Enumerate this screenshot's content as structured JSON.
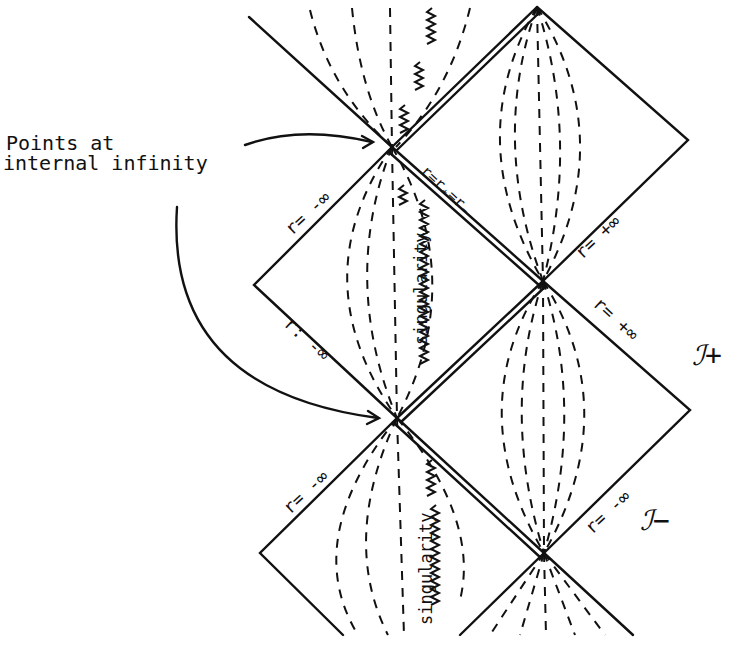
{
  "diagram": {
    "type": "Penrose (conformal) diagram",
    "callout": {
      "line1": "Points   at",
      "line2": "internal infinity"
    },
    "labels": {
      "horizon": "r=r₊=r₋",
      "r_minus_inf_1": "r= -∞",
      "r_minus_inf_2": "r: -∞",
      "r_minus_inf_3": "r= -∞",
      "r_plus_inf_1": "r= +∞",
      "r_plus_inf_2": "r= +∞",
      "r_minus_inf_4": "r= -∞",
      "scri_plus": "ℐ+",
      "scri_minus": "ℐ−",
      "singularity_1": "singularity",
      "singularity_2": "singularity"
    },
    "colors": {
      "ink": "#111111",
      "paper": "#ffffff"
    }
  }
}
